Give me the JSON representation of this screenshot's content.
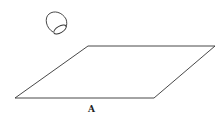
{
  "diagram": {
    "label": "A",
    "shapes": [
      {
        "type": "parallelogram",
        "points": [
          [
            88,
            46
          ],
          [
            215,
            46
          ],
          [
            154,
            98
          ],
          [
            15,
            98
          ]
        ]
      },
      {
        "type": "bullet-shaped-object",
        "center": [
          56,
          22
        ]
      }
    ],
    "stroke_color": "#333333"
  }
}
